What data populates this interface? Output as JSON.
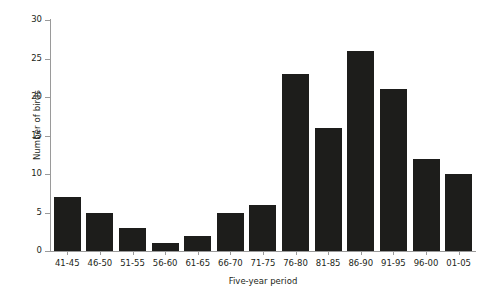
{
  "chart_data": {
    "type": "bar",
    "title": "",
    "xlabel": "Five-year period",
    "ylabel": "Number of birds",
    "categories": [
      "41-45",
      "46-50",
      "51-55",
      "56-60",
      "61-65",
      "66-70",
      "71-75",
      "76-80",
      "81-85",
      "86-90",
      "91-95",
      "96-00",
      "01-05"
    ],
    "values": [
      7,
      5,
      3,
      1,
      2,
      5,
      6,
      23,
      16,
      26,
      21,
      12,
      10
    ],
    "ylim": [
      0,
      30
    ],
    "ytick_labels": [
      "0",
      "5",
      "10",
      "15",
      "20",
      "25",
      "30"
    ],
    "ytick_values": [
      0,
      5,
      10,
      15,
      20,
      25,
      30
    ],
    "grid": false,
    "legend": null,
    "bar_color": "#1d1d1b",
    "axis_color": "#9a9a9a",
    "text_color": "#231f20",
    "background": "#ffffff"
  }
}
